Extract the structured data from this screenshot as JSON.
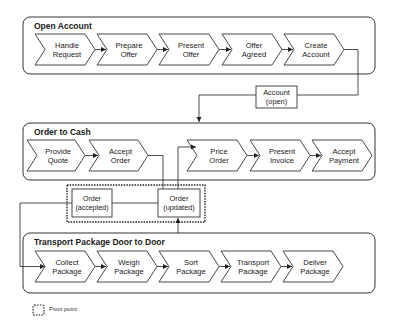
{
  "containers": [
    {
      "title": "Open Account",
      "steps": [
        {
          "line1": "Handle",
          "line2": "Request"
        },
        {
          "line1": "Prepare",
          "line2": "Offer"
        },
        {
          "line1": "Present",
          "line2": "Offer"
        },
        {
          "line1": "Offer",
          "line2": "Agreed"
        },
        {
          "line1": "Create",
          "line2": "Account"
        }
      ]
    },
    {
      "title": "Order to Cash",
      "steps": [
        {
          "line1": "Provide",
          "line2": "Quote"
        },
        {
          "line1": "Accept",
          "line2": "Order"
        },
        {
          "line1": "Price",
          "line2": "Order"
        },
        {
          "line1": "Present",
          "line2": "Invoice"
        },
        {
          "line1": "Accept",
          "line2": "Payment"
        }
      ]
    },
    {
      "title": "Transport Package Door to Door",
      "steps": [
        {
          "line1": "Collect",
          "line2": "Package"
        },
        {
          "line1": "Weigh",
          "line2": "Package"
        },
        {
          "line1": "Sort",
          "line2": "Package"
        },
        {
          "line1": "Transport",
          "line2": "Package"
        },
        {
          "line1": "Deliver",
          "line2": "Package"
        }
      ]
    }
  ],
  "objects": {
    "account_open": {
      "line1": "Account",
      "line2": "(open)"
    },
    "order_accepted": {
      "line1": "Order",
      "line2": "(accepted)"
    },
    "order_updated": {
      "line1": "Order",
      "line2": "(updated)"
    }
  },
  "legend": {
    "pivot_point": "Pivot point"
  }
}
